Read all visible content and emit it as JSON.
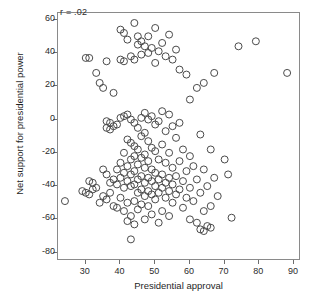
{
  "chart_data": {
    "type": "scatter",
    "title": "",
    "xlabel": "Presidential approval",
    "ylabel": "Net support for presidential power",
    "annotation": "r = .02",
    "xlim": [
      22,
      92
    ],
    "ylim": [
      -85,
      64
    ],
    "xticks": [
      30,
      40,
      50,
      60,
      70,
      80,
      90
    ],
    "yticks": [
      60,
      40,
      20,
      0,
      -20,
      -40,
      -60,
      -80
    ],
    "grid": false,
    "legend": null,
    "marker": {
      "shape": "open-circle",
      "size": 7,
      "stroke": "#4a4a4a",
      "fill": "none"
    },
    "points": [
      [
        24,
        -49
      ],
      [
        30,
        37
      ],
      [
        31,
        37
      ],
      [
        31,
        -37
      ],
      [
        32,
        -38
      ],
      [
        29,
        -43
      ],
      [
        30,
        -44
      ],
      [
        31,
        -45
      ],
      [
        32,
        -42
      ],
      [
        33,
        -41
      ],
      [
        33,
        28
      ],
      [
        34,
        22
      ],
      [
        34,
        -50
      ],
      [
        35,
        19
      ],
      [
        35,
        -30
      ],
      [
        35,
        -46
      ],
      [
        36,
        35
      ],
      [
        36,
        -1
      ],
      [
        36,
        -5
      ],
      [
        36,
        -33
      ],
      [
        36,
        -48
      ],
      [
        37,
        -2
      ],
      [
        37,
        -6
      ],
      [
        37,
        -38
      ],
      [
        37,
        -44
      ],
      [
        38,
        16
      ],
      [
        38,
        -4
      ],
      [
        38,
        -36
      ],
      [
        38,
        -52
      ],
      [
        39,
        -3
      ],
      [
        39,
        -30
      ],
      [
        39,
        -39
      ],
      [
        39,
        -53
      ],
      [
        40,
        54
      ],
      [
        40,
        36
      ],
      [
        40,
        1
      ],
      [
        40,
        -26
      ],
      [
        40,
        -35
      ],
      [
        40,
        -47
      ],
      [
        41,
        52
      ],
      [
        41,
        35
      ],
      [
        41,
        2
      ],
      [
        41,
        -20
      ],
      [
        41,
        -32
      ],
      [
        41,
        -41
      ],
      [
        41,
        -55
      ],
      [
        42,
        48
      ],
      [
        42,
        3
      ],
      [
        42,
        -12
      ],
      [
        42,
        -28
      ],
      [
        42,
        -37
      ],
      [
        42,
        -50
      ],
      [
        42,
        -61
      ],
      [
        43,
        38
      ],
      [
        43,
        0
      ],
      [
        43,
        -14
      ],
      [
        43,
        -24
      ],
      [
        43,
        -33
      ],
      [
        43,
        -40
      ],
      [
        43,
        -58
      ],
      [
        43,
        -72
      ],
      [
        44,
        58
      ],
      [
        44,
        36
      ],
      [
        44,
        -2
      ],
      [
        44,
        -16
      ],
      [
        44,
        -22
      ],
      [
        44,
        -31
      ],
      [
        44,
        -39
      ],
      [
        44,
        -49
      ],
      [
        44,
        -63
      ],
      [
        45,
        50
      ],
      [
        45,
        45
      ],
      [
        45,
        -5
      ],
      [
        45,
        -18
      ],
      [
        45,
        -27
      ],
      [
        45,
        -36
      ],
      [
        45,
        -44
      ],
      [
        45,
        -54
      ],
      [
        46,
        47
      ],
      [
        46,
        39
      ],
      [
        46,
        1
      ],
      [
        46,
        -10
      ],
      [
        46,
        -23
      ],
      [
        46,
        -34
      ],
      [
        46,
        -42
      ],
      [
        46,
        -51
      ],
      [
        47,
        44
      ],
      [
        47,
        4
      ],
      [
        47,
        -8
      ],
      [
        47,
        -21
      ],
      [
        47,
        -29
      ],
      [
        47,
        -38
      ],
      [
        47,
        -46
      ],
      [
        47,
        -60
      ],
      [
        48,
        50
      ],
      [
        48,
        40
      ],
      [
        48,
        0
      ],
      [
        48,
        -13
      ],
      [
        48,
        -25
      ],
      [
        48,
        -35
      ],
      [
        48,
        -43
      ],
      [
        48,
        -52
      ],
      [
        49,
        43
      ],
      [
        49,
        2
      ],
      [
        49,
        -17
      ],
      [
        49,
        -30
      ],
      [
        49,
        -37
      ],
      [
        49,
        -45
      ],
      [
        49,
        -57
      ],
      [
        50,
        55
      ],
      [
        50,
        34
      ],
      [
        50,
        -3
      ],
      [
        50,
        -19
      ],
      [
        50,
        -32
      ],
      [
        50,
        -40
      ],
      [
        50,
        -48
      ],
      [
        51,
        41
      ],
      [
        51,
        -1
      ],
      [
        51,
        -24
      ],
      [
        51,
        -36
      ],
      [
        51,
        -44
      ],
      [
        51,
        -62
      ],
      [
        52,
        46
      ],
      [
        52,
        5
      ],
      [
        52,
        -15
      ],
      [
        52,
        -33
      ],
      [
        52,
        -41
      ],
      [
        52,
        -55
      ],
      [
        53,
        38
      ],
      [
        53,
        -7
      ],
      [
        53,
        -26
      ],
      [
        53,
        -38
      ],
      [
        53,
        -47
      ],
      [
        54,
        51
      ],
      [
        54,
        3
      ],
      [
        54,
        -20
      ],
      [
        54,
        -35
      ],
      [
        54,
        -43
      ],
      [
        54,
        -58
      ],
      [
        55,
        36
      ],
      [
        55,
        -4
      ],
      [
        55,
        -29
      ],
      [
        55,
        -39
      ],
      [
        55,
        -50
      ],
      [
        56,
        42
      ],
      [
        56,
        -11
      ],
      [
        56,
        -34
      ],
      [
        56,
        -45
      ],
      [
        57,
        30
      ],
      [
        57,
        -2
      ],
      [
        57,
        -25
      ],
      [
        57,
        -42
      ],
      [
        58,
        -18
      ],
      [
        58,
        -37
      ],
      [
        58,
        -53
      ],
      [
        59,
        27
      ],
      [
        59,
        -31
      ],
      [
        59,
        -47
      ],
      [
        60,
        12
      ],
      [
        60,
        -22
      ],
      [
        60,
        -41
      ],
      [
        60,
        -60
      ],
      [
        61,
        -28
      ],
      [
        61,
        -49
      ],
      [
        62,
        19
      ],
      [
        62,
        -36
      ],
      [
        62,
        -62
      ],
      [
        63,
        -9
      ],
      [
        63,
        -44
      ],
      [
        63,
        -66
      ],
      [
        64,
        22
      ],
      [
        64,
        -30
      ],
      [
        64,
        -55
      ],
      [
        64,
        -67
      ],
      [
        65,
        -40
      ],
      [
        65,
        -64
      ],
      [
        66,
        -18
      ],
      [
        66,
        -52
      ],
      [
        66,
        -65
      ],
      [
        67,
        28
      ],
      [
        67,
        -35
      ],
      [
        68,
        -46
      ],
      [
        70,
        -24
      ],
      [
        71,
        -33
      ],
      [
        72,
        -59
      ],
      [
        74,
        44
      ],
      [
        79,
        47
      ],
      [
        88,
        28
      ]
    ]
  }
}
